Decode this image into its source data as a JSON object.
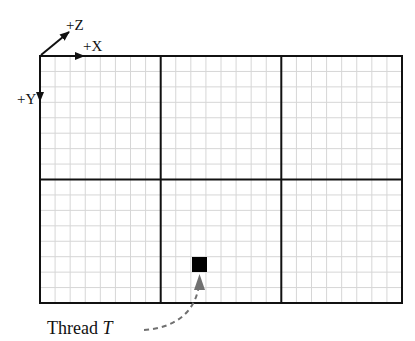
{
  "axes": {
    "x_label": "+X",
    "y_label": "+Y",
    "z_label": "+Z"
  },
  "grid": {
    "blocks_x": 3,
    "blocks_y": 2,
    "cells_per_block_x": 8,
    "cells_per_block_y": 8,
    "block_line_color": "#111111",
    "cell_line_color": "#d6d6d6"
  },
  "thread": {
    "label_prefix": "Thread ",
    "label_var": "T",
    "block": [
      1,
      1
    ],
    "cell": [
      2,
      5
    ],
    "fill": "#000000",
    "arrow_color": "#707070"
  }
}
